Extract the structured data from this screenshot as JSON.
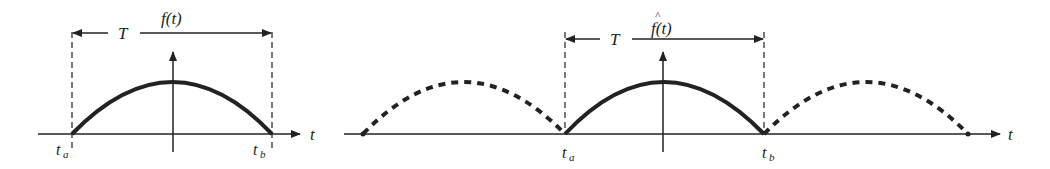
{
  "left_panel": {
    "function_label": "f(t)",
    "period_label": "T",
    "t_axis_label": "t",
    "start_label": "t",
    "start_sub": "a",
    "end_label": "t",
    "end_sub": "b"
  },
  "right_panel": {
    "function_label": "f(t)",
    "function_hat": "^",
    "period_label": "T",
    "t_axis_label": "t",
    "start_label": "t",
    "start_sub": "a",
    "end_label": "t",
    "end_sub": "b"
  },
  "colors": {
    "stroke": "#222222",
    "background": "#ffffff"
  }
}
